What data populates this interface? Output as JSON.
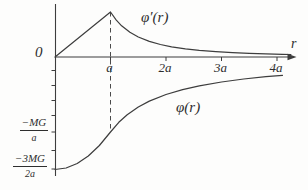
{
  "figure": {
    "background": "#fdfdfc",
    "line_color": "#3d3d3d",
    "text_color": "#2e2e2e"
  },
  "chart_data": {
    "type": "line",
    "title": "",
    "xlabel": "r",
    "ylabel": "",
    "origin_label": "0",
    "x_range_units_a": [
      0,
      4.3
    ],
    "grid": false,
    "legend": "inline curve labels",
    "x_ticks": [
      {
        "value": 1,
        "label": "a"
      },
      {
        "value": 2,
        "label": "2a"
      },
      {
        "value": 3,
        "label": "3a"
      },
      {
        "value": 4,
        "label": "4a"
      }
    ],
    "y_axis_labels": [
      {
        "value_in_MG_over_a": -1,
        "num": "−MG",
        "den": "a"
      },
      {
        "value_in_MG_over_a": -1.5,
        "num": "−3MG",
        "den": "2a"
      }
    ],
    "series": [
      {
        "id": "phi_prime",
        "name": "φ′(r)",
        "units": "MG/a²",
        "points": [
          [
            0,
            0
          ],
          [
            1,
            1
          ],
          [
            1.1,
            0.826
          ],
          [
            1.2,
            0.694
          ],
          [
            1.35,
            0.549
          ],
          [
            1.5,
            0.444
          ],
          [
            1.7,
            0.346
          ],
          [
            1.9,
            0.277
          ],
          [
            2.1,
            0.227
          ],
          [
            2.35,
            0.181
          ],
          [
            2.6,
            0.148
          ],
          [
            2.9,
            0.119
          ],
          [
            3.2,
            0.098
          ],
          [
            3.5,
            0.082
          ],
          [
            3.8,
            0.069
          ],
          [
            4.1,
            0.059
          ],
          [
            4.25,
            0.055
          ]
        ]
      },
      {
        "id": "phi",
        "name": "φ(r)",
        "units": "MG/a",
        "points": [
          [
            0,
            -1.5
          ],
          [
            0.2,
            -1.48
          ],
          [
            0.4,
            -1.42
          ],
          [
            0.6,
            -1.32
          ],
          [
            0.8,
            -1.18
          ],
          [
            1,
            -1
          ],
          [
            1.15,
            -0.87
          ],
          [
            1.3,
            -0.769
          ],
          [
            1.5,
            -0.667
          ],
          [
            1.7,
            -0.588
          ],
          [
            2,
            -0.5
          ],
          [
            2.3,
            -0.435
          ],
          [
            2.6,
            -0.385
          ],
          [
            3,
            -0.333
          ],
          [
            3.4,
            -0.294
          ],
          [
            3.8,
            -0.263
          ],
          [
            4.1,
            -0.244
          ]
        ]
      }
    ],
    "annotations": [
      {
        "type": "dashed-vline",
        "x": 1,
        "top_value_MG_over_a2": 1,
        "bottom_value_MG_over_a": -1
      }
    ]
  }
}
